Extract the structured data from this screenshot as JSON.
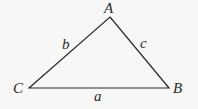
{
  "diagram": {
    "type": "triangle",
    "background": "#f7f7f5",
    "stroke_color": "#2a2a2a",
    "vertices": [
      {
        "name": "A",
        "x": 110,
        "y": 17,
        "label": "A",
        "label_x": 104,
        "label_y": 13
      },
      {
        "name": "B",
        "x": 169,
        "y": 88,
        "label": "B",
        "label_x": 173,
        "label_y": 93
      },
      {
        "name": "C",
        "x": 29,
        "y": 88,
        "label": "C",
        "label_x": 13,
        "label_y": 93
      }
    ],
    "sides": [
      {
        "name": "a",
        "label": "a",
        "label_x": 94,
        "label_y": 101,
        "from": "C",
        "to": "B"
      },
      {
        "name": "b",
        "label": "b",
        "label_x": 62,
        "label_y": 49,
        "from": "C",
        "to": "A"
      },
      {
        "name": "c",
        "label": "c",
        "label_x": 140,
        "label_y": 48,
        "from": "A",
        "to": "B"
      }
    ]
  }
}
